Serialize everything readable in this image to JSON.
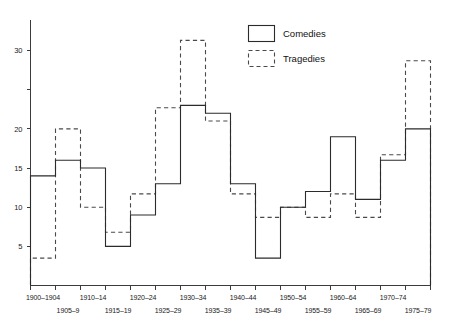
{
  "chart_data": {
    "type": "line",
    "subtype": "step-histogram",
    "title": "",
    "subtitle": "",
    "xlabel": "",
    "ylabel": "",
    "grid": false,
    "legend_position": "top-right",
    "categories": [
      "1900–1904",
      "1905–9",
      "1910–14",
      "1915–19",
      "1920–24",
      "1925–29",
      "1930–34",
      "1935–39",
      "1940–44",
      "1945–49",
      "1950–54",
      "1955–59",
      "1960–64",
      "1965–69",
      "1970–74",
      "1975–79"
    ],
    "series": [
      {
        "name": "Comedies",
        "style": "solid",
        "values": [
          14,
          16,
          15,
          5,
          9,
          13,
          23,
          22,
          13,
          3.5,
          10,
          12,
          19,
          11,
          16,
          20
        ]
      },
      {
        "name": "Tragedies",
        "style": "dashed",
        "values": [
          3.5,
          20,
          10,
          6.8,
          11.7,
          22.7,
          31.3,
          21,
          11.7,
          8.7,
          10,
          8.7,
          11.7,
          8.7,
          16.7,
          28.7
        ]
      }
    ],
    "ylim": [
      0,
      33
    ],
    "yticks": [
      5,
      10,
      15,
      20,
      25,
      30
    ],
    "ytick_labels": [
      "5",
      "10",
      "15",
      "20",
      "25",
      "30"
    ],
    "ytick_labels_shown": [
      "5",
      "10",
      "15",
      "20",
      "",
      "30"
    ],
    "xlim": [
      0,
      16
    ]
  },
  "legend": {
    "entries": [
      {
        "label": "Comedies",
        "style": "solid"
      },
      {
        "label": "Tragedies",
        "style": "dashed"
      }
    ]
  },
  "colors": {
    "comedies": "#2b2b2b",
    "tragedies": "#4a4a4a",
    "axis": "#3b3b3b",
    "background": "#ffffff"
  }
}
